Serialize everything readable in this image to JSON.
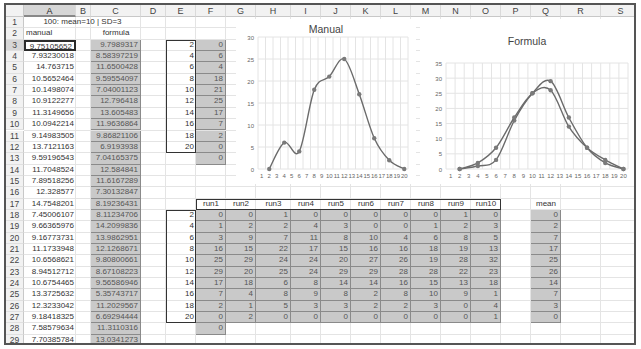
{
  "sheet": {
    "columns": [
      "A",
      "B",
      "C",
      "D",
      "E",
      "F",
      "G",
      "H",
      "I",
      "J",
      "K",
      "L",
      "M",
      "N",
      "O",
      "P",
      "Q",
      "R",
      "S"
    ],
    "selected_column": "A",
    "selected_row": 3,
    "rows": [
      "1",
      "2",
      "3",
      "4",
      "5",
      "6",
      "7",
      "8",
      "9",
      "10",
      "11",
      "12",
      "13",
      "14",
      "15",
      "16",
      "17",
      "18",
      "19",
      "20",
      "21",
      "22",
      "23",
      "24",
      "25",
      "26",
      "27",
      "28",
      "29"
    ]
  },
  "header_note": "100: mean=10 | SD=3",
  "col_a_header": "manual",
  "col_c_header": "formula",
  "manual_values": [
    "9.75105652",
    "7.93230018",
    "14.763715",
    "10.5652464",
    "10.1498074",
    "10.9122277",
    "11.3149656",
    "10.0942214",
    "9.14983505",
    "13.7121163",
    "9.59196543",
    "11.7048524",
    "7.89518256",
    "12.328577",
    "14.7548201",
    "7.45006107",
    "9.66365976",
    "9.16773731",
    "11.1733948",
    "10.6568621",
    "8.94512712",
    "10.6754465",
    "13.3725632",
    "12.3233042",
    "9.18418325",
    "7.58579634",
    "7.70385784"
  ],
  "formula_values": [
    "9.7989317",
    "8.58397219",
    "11.6500428",
    "9.59554097",
    "7.04001123",
    "12.796418",
    "13.605483",
    "11.9636864",
    "9.86821106",
    "6.9193938",
    "7.04165375",
    "12.584841",
    "11.6167289",
    "7.30132847",
    "8.19236431",
    "8.11234706",
    "14.2099836",
    "13.9862951",
    "12.1268671",
    "9.80800661",
    "8.67108223",
    "9.56586946",
    "5.35743717",
    "11.2029567",
    "6.69294444",
    "11.3110316",
    "13.0341273"
  ],
  "bins_table": {
    "bins": [
      "2",
      "4",
      "6",
      "8",
      "10",
      "12",
      "14",
      "16",
      "18",
      "20"
    ],
    "counts": [
      "0",
      "6",
      "4",
      "18",
      "21",
      "25",
      "17",
      "7",
      "2",
      "0"
    ],
    "extra": "0"
  },
  "runs_table": {
    "headers": [
      "run1",
      "run2",
      "run3",
      "run4",
      "run5",
      "run6",
      "run7",
      "run8",
      "run9",
      "run10"
    ],
    "bins": [
      "2",
      "4",
      "6",
      "8",
      "10",
      "12",
      "14",
      "16",
      "18",
      "20"
    ],
    "rows": [
      [
        "0",
        "0",
        "1",
        "0",
        "0",
        "0",
        "0",
        "0",
        "1",
        "0"
      ],
      [
        "1",
        "2",
        "2",
        "4",
        "3",
        "0",
        "0",
        "1",
        "2",
        "3"
      ],
      [
        "3",
        "9",
        "7",
        "11",
        "8",
        "10",
        "4",
        "6",
        "8",
        "5"
      ],
      [
        "16",
        "15",
        "22",
        "17",
        "15",
        "16",
        "16",
        "18",
        "19",
        "13"
      ],
      [
        "25",
        "29",
        "24",
        "24",
        "20",
        "27",
        "26",
        "19",
        "28",
        "32"
      ],
      [
        "29",
        "20",
        "25",
        "24",
        "29",
        "29",
        "28",
        "28",
        "22",
        "23"
      ],
      [
        "17",
        "18",
        "6",
        "8",
        "14",
        "14",
        "16",
        "15",
        "13",
        "18"
      ],
      [
        "7",
        "4",
        "8",
        "9",
        "8",
        "2",
        "8",
        "10",
        "9",
        "1"
      ],
      [
        "2",
        "1",
        "5",
        "3",
        "3",
        "2",
        "2",
        "3",
        "0",
        "4"
      ],
      [
        "0",
        "2",
        "0",
        "0",
        "0",
        "0",
        "0",
        "0",
        "0",
        "1"
      ]
    ],
    "extra": "0",
    "mean_header": "mean",
    "mean": [
      "0",
      "2",
      "7",
      "17",
      "25",
      "26",
      "14",
      "7",
      "3",
      "0"
    ]
  },
  "chart_data": [
    {
      "type": "line",
      "title": "Manual",
      "x": [
        2,
        4,
        6,
        8,
        10,
        12,
        14,
        16,
        18,
        20
      ],
      "xticks": [
        "1",
        "2",
        "3",
        "4",
        "5",
        "6",
        "7",
        "8",
        "9",
        "10",
        "11",
        "12",
        "13",
        "14",
        "15",
        "16",
        "17",
        "18",
        "19",
        "20"
      ],
      "series": [
        {
          "name": "manual",
          "values": [
            0,
            6,
            4,
            18,
            21,
            25,
            17,
            7,
            2,
            0
          ]
        }
      ],
      "ylim": [
        0,
        30
      ],
      "yticks": [
        "0",
        "5",
        "10",
        "15",
        "20",
        "25",
        "30"
      ],
      "grid": true,
      "smooth": true
    },
    {
      "type": "line",
      "title": "Formula",
      "x": [
        2,
        4,
        6,
        8,
        10,
        12,
        14,
        16,
        18,
        20
      ],
      "xticks": [
        "1",
        "2",
        "3",
        "4",
        "5",
        "6",
        "7",
        "8",
        "9",
        "10",
        "11",
        "12",
        "13",
        "14",
        "15",
        "16",
        "17",
        "18",
        "19",
        "20"
      ],
      "series": [
        {
          "name": "run1",
          "values": [
            0,
            1,
            3,
            16,
            25,
            29,
            17,
            7,
            2,
            0
          ]
        },
        {
          "name": "mean",
          "values": [
            0,
            2,
            7,
            17,
            25,
            26,
            14,
            7,
            3,
            0
          ]
        }
      ],
      "ylim": [
        0,
        35
      ],
      "yticks": [
        "0",
        "5",
        "10",
        "15",
        "20",
        "25",
        "30",
        "35"
      ],
      "grid": true,
      "smooth": true
    }
  ],
  "colors": {
    "line": "#6b6b6b",
    "marker": "#7a7a7a",
    "shade": "#c9c9c9",
    "grid": "#e4e4e4"
  }
}
